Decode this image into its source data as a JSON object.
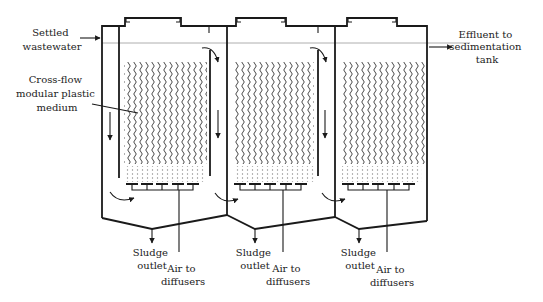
{
  "labels": {
    "settled_wastewater": [
      "Settled",
      "wastewater"
    ],
    "media": [
      "Cross-flow",
      "modular plastic",
      "medium"
    ],
    "effluent": [
      "Effluent to",
      "sedimentation",
      "tank"
    ],
    "sludge_outlet": [
      "Sludge",
      "outlet"
    ],
    "air_to_diffusers": [
      "Air to",
      "diffusers"
    ]
  },
  "tanks": [
    {
      "id": 1,
      "left": 102,
      "right": 227,
      "lid_left": 130,
      "lid_right": 176,
      "baffle_in": 119,
      "baffle_out": 210,
      "notch": 209,
      "sludge_x": 152,
      "air_x": 179
    },
    {
      "id": 2,
      "left": 227,
      "right": 335,
      "lid_left": 241,
      "lid_right": 281,
      "baffle_in": 232,
      "baffle_out": 318,
      "notch": 318,
      "sludge_x": 255,
      "air_x": 283
    },
    {
      "id": 3,
      "left": 335,
      "right": 427,
      "lid_left": 352,
      "lid_right": 392,
      "baffle_in": 340,
      "baffle_out": 0,
      "notch": 0,
      "sludge_x": 359,
      "air_x": 387
    }
  ],
  "colors": {
    "line": "#1a1a1a",
    "water_line": "#9a9a9a",
    "text": "#222222"
  }
}
